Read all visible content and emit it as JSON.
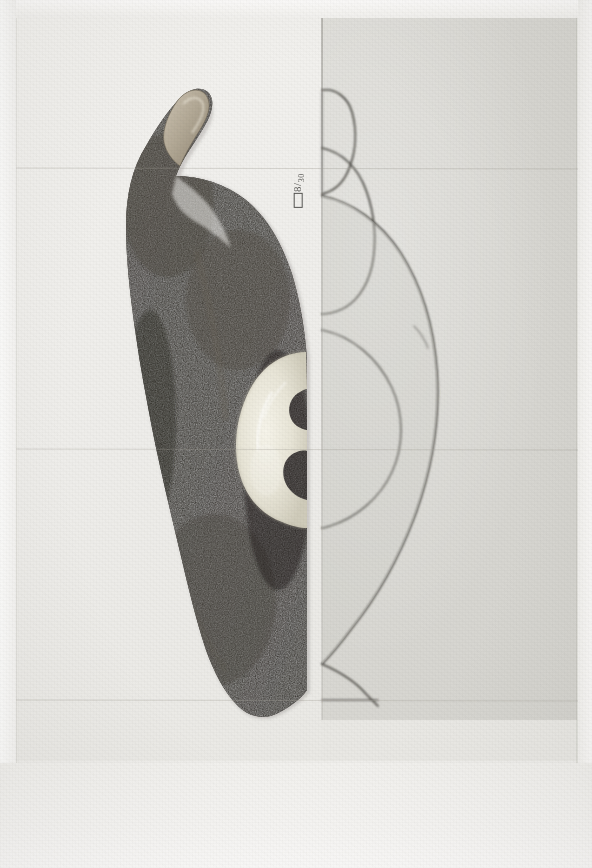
{
  "document": {
    "kind": "scanned-figure-plate",
    "orientation": "landscape-specimen-rotated",
    "page_background": "#f2f1ef"
  },
  "plate": {
    "photo_panel": {
      "label": "photograph of specimen",
      "background": "#eeedea"
    },
    "drawing_panel": {
      "label": "outline drawing of specimen",
      "background": "#d9d8d3",
      "outline_color": "#4a4843"
    }
  },
  "annotations": {
    "scale_label": {
      "text": "8",
      "denominator": "30",
      "separator": "/",
      "icon": "rectangle-scale-bar"
    },
    "plate_caption": "Plate 1"
  },
  "specimen": {
    "name": "dark-stone-specimen",
    "body_color": "#2e2b27",
    "body_color_light": "#514c45",
    "inclusion_color": "#eceade",
    "tip_color": "#b5ab9a",
    "description": "dark coarse-grained stone object with hooked upper projection, pale tip, and a light crescent-shaped inclusion"
  },
  "colors": {
    "paper": "#f2f1ef",
    "grey_panel": "#d9d8d3",
    "ink": "#4a4843",
    "specimen_dark": "#2e2b27",
    "specimen_light": "#eceade"
  }
}
